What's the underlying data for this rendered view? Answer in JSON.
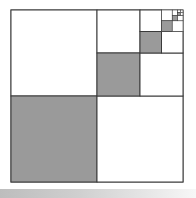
{
  "diagram": {
    "type": "recursive-square-subdivision",
    "outer": {
      "x": 11,
      "y": 10,
      "size": 172
    },
    "colors": {
      "fill_shaded": "#9a9a9a",
      "fill_plain": "#ffffff",
      "stroke": "#3a3a3a",
      "bottom_bar_start": "#bdbdbd",
      "bottom_bar_end": "#f7f7f7"
    },
    "levels": 6
  }
}
